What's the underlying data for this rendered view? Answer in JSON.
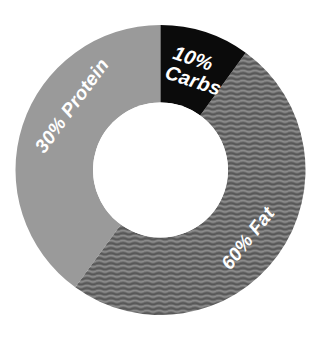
{
  "chart_data": {
    "type": "pie",
    "variant": "donut",
    "title": "",
    "subtitle": "",
    "xlabel": "",
    "ylabel": "",
    "legend": "none",
    "grid": false,
    "unit": "%",
    "total": 100,
    "categories": [
      "Carbs",
      "Fat",
      "Protein"
    ],
    "values": [
      10,
      60,
      30
    ],
    "start_angle_deg": 0,
    "direction": "clockwise",
    "inner_radius_ratio": 0.465,
    "slices": [
      {
        "name": "Carbs",
        "value": 10,
        "label": "10%\nCarbs",
        "label_line1": "10%",
        "label_line2": "Carbs",
        "percent_text": "10%",
        "color": "#0b0b0b",
        "fill_style": "solid",
        "text_color": "#ffffff",
        "start_angle_deg": 0,
        "end_angle_deg": 36,
        "label_rotation_deg": 18
      },
      {
        "name": "Fat",
        "value": 60,
        "label": "60% Fat",
        "label_line1": "60% Fat",
        "label_line2": "",
        "percent_text": "60%",
        "color": "#6e6e6e",
        "fill_style": "wavy-lines",
        "text_color": "#ffffff",
        "start_angle_deg": 36,
        "end_angle_deg": 216,
        "label_rotation_deg": -36
      },
      {
        "name": "Protein",
        "value": 30,
        "label": "30% Protein",
        "label_line1": "30% Protein",
        "label_line2": "",
        "percent_text": "30%",
        "color": "#9a9a9a",
        "fill_style": "solid",
        "text_color": "#ffffff",
        "start_angle_deg": 216,
        "end_angle_deg": 360,
        "label_rotation_deg": -52
      }
    ],
    "geometry": {
      "center_x": 160.5,
      "center_y": 170,
      "outer_radius": 145,
      "inner_radius": 67.5
    },
    "colors": {
      "background": "#ffffff",
      "carbs": "#0b0b0b",
      "fat": "#6e6e6e",
      "fat_texture_dark": "#5c5c5c",
      "fat_texture_light": "#7e7e7e",
      "protein": "#9a9a9a",
      "label_text": "#ffffff",
      "hole": "#ffffff"
    }
  },
  "labels": {
    "carbs_line1": "10%",
    "carbs_line2": "Carbs",
    "fat": "60% Fat",
    "protein": "30% Protein"
  }
}
